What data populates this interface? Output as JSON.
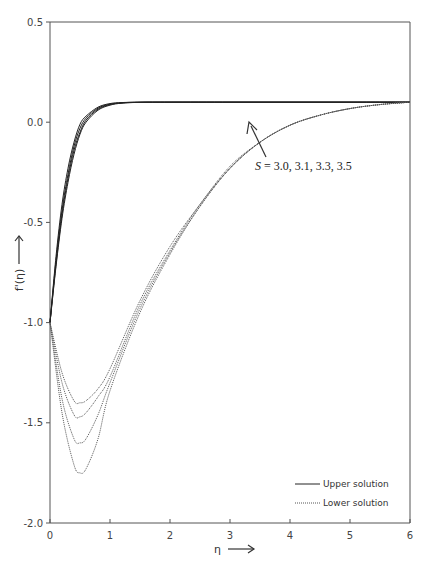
{
  "chart_data": {
    "type": "line",
    "title": "",
    "xlabel": "η",
    "ylabel": "f'(η)",
    "xlim": [
      0,
      6
    ],
    "ylim": [
      -2.0,
      0.5
    ],
    "x_ticks": [
      "0",
      "1",
      "2",
      "3",
      "4",
      "5",
      "6"
    ],
    "y_ticks": [
      "0.5",
      "0.0",
      "-0.5",
      "-1.0",
      "-1.5",
      "-2.0"
    ],
    "grid": false,
    "legend_position": "lower right",
    "legend": [
      "Upper solution",
      "Lower solution"
    ],
    "annotation": "S = 3.0, 3.1, 3.3, 3.5",
    "annotation_label": {
      "var": "S",
      "values": " = 3.0, 3.1, 3.3, 3.5"
    },
    "S_values": [
      3.0,
      3.1,
      3.3,
      3.5
    ],
    "series": [
      {
        "name": "Upper solution S=3.0",
        "style": "solid",
        "x": [
          0,
          0.1,
          0.2,
          0.3,
          0.4,
          0.5,
          0.6,
          0.8,
          1.0,
          1.2,
          1.5,
          2,
          3,
          4,
          5,
          6
        ],
        "y": [
          -1.0,
          -0.72,
          -0.48,
          -0.3,
          -0.16,
          -0.06,
          0.0,
          0.06,
          0.085,
          0.095,
          0.099,
          0.1,
          0.1,
          0.1,
          0.1,
          0.1
        ]
      },
      {
        "name": "Upper solution S=3.1",
        "style": "solid",
        "x": [
          0,
          0.1,
          0.2,
          0.3,
          0.4,
          0.5,
          0.6,
          0.8,
          1.0,
          1.2,
          1.5,
          2,
          3,
          4,
          5,
          6
        ],
        "y": [
          -1.0,
          -0.71,
          -0.46,
          -0.28,
          -0.14,
          -0.05,
          0.01,
          0.065,
          0.088,
          0.096,
          0.099,
          0.1,
          0.1,
          0.1,
          0.1,
          0.1
        ]
      },
      {
        "name": "Upper solution S=3.3",
        "style": "solid",
        "x": [
          0,
          0.1,
          0.2,
          0.3,
          0.4,
          0.5,
          0.6,
          0.8,
          1.0,
          1.2,
          1.5,
          2,
          3,
          4,
          5,
          6
        ],
        "y": [
          -1.0,
          -0.69,
          -0.44,
          -0.26,
          -0.12,
          -0.03,
          0.02,
          0.07,
          0.09,
          0.097,
          0.1,
          0.1,
          0.1,
          0.1,
          0.1,
          0.1
        ]
      },
      {
        "name": "Upper solution S=3.5",
        "style": "solid",
        "x": [
          0,
          0.1,
          0.2,
          0.3,
          0.4,
          0.5,
          0.6,
          0.8,
          1.0,
          1.2,
          1.5,
          2,
          3,
          4,
          5,
          6
        ],
        "y": [
          -1.0,
          -0.67,
          -0.41,
          -0.23,
          -0.1,
          -0.01,
          0.03,
          0.075,
          0.093,
          0.098,
          0.1,
          0.1,
          0.1,
          0.1,
          0.1,
          0.1
        ]
      },
      {
        "name": "Lower solution S=3.0",
        "style": "dotted",
        "x": [
          0,
          0.2,
          0.4,
          0.5,
          0.6,
          0.8,
          1.0,
          1.5,
          2.0,
          2.5,
          3.0,
          3.5,
          4.0,
          4.5,
          5.0,
          5.5,
          6.0
        ],
        "y": [
          -1.0,
          -1.45,
          -1.71,
          -1.75,
          -1.73,
          -1.58,
          -1.34,
          -0.95,
          -0.66,
          -0.42,
          -0.23,
          -0.1,
          -0.015,
          0.035,
          0.068,
          0.088,
          0.1
        ]
      },
      {
        "name": "Lower solution S=3.1",
        "style": "dotted",
        "x": [
          0,
          0.2,
          0.4,
          0.5,
          0.6,
          0.8,
          1.0,
          1.5,
          2.0,
          2.5,
          3.0,
          3.5,
          4.0,
          4.5,
          5.0,
          5.5,
          6.0
        ],
        "y": [
          -1.0,
          -1.38,
          -1.58,
          -1.6,
          -1.58,
          -1.46,
          -1.3,
          -0.93,
          -0.65,
          -0.42,
          -0.23,
          -0.1,
          -0.015,
          0.035,
          0.068,
          0.088,
          0.1
        ]
      },
      {
        "name": "Lower solution S=3.3",
        "style": "dotted",
        "x": [
          0,
          0.2,
          0.4,
          0.5,
          0.6,
          0.8,
          1.0,
          1.5,
          2.0,
          2.5,
          3.0,
          3.5,
          4.0,
          4.5,
          5.0,
          5.5,
          6.0
        ],
        "y": [
          -1.0,
          -1.3,
          -1.46,
          -1.47,
          -1.45,
          -1.37,
          -1.27,
          -0.91,
          -0.64,
          -0.41,
          -0.23,
          -0.1,
          -0.015,
          0.035,
          0.068,
          0.088,
          0.1
        ]
      },
      {
        "name": "Lower solution S=3.5",
        "style": "dotted",
        "x": [
          0,
          0.2,
          0.4,
          0.5,
          0.6,
          0.8,
          1.0,
          1.5,
          2.0,
          2.5,
          3.0,
          3.5,
          4.0,
          4.5,
          5.0,
          5.5,
          6.0
        ],
        "y": [
          -1.0,
          -1.25,
          -1.39,
          -1.4,
          -1.39,
          -1.33,
          -1.23,
          -0.89,
          -0.62,
          -0.41,
          -0.22,
          -0.1,
          -0.015,
          0.035,
          0.068,
          0.088,
          0.1
        ]
      }
    ]
  },
  "labels": {
    "xlabel": "η",
    "ylabel": "f'(η)",
    "legend_upper": "Upper solution",
    "legend_lower": "Lower solution",
    "annotation_var": "S",
    "annotation_values": " = 3.0, 3.1, 3.3, 3.5"
  },
  "colors": {
    "axis": "#555555",
    "upper_line": "#222222",
    "lower_line": "#555555",
    "text": "#444444"
  }
}
